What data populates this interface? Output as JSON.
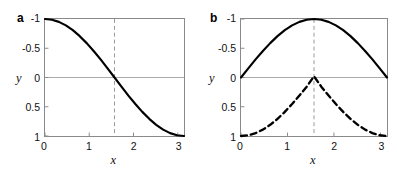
{
  "figure": {
    "background": "#ffffff",
    "panels": [
      {
        "id": "a",
        "label": "a",
        "y_label": "y",
        "x_label": "x",
        "y_ticks": [
          "1",
          "0.5",
          "0",
          "-0.5",
          "-1"
        ],
        "y_tick_values": [
          1,
          0.5,
          0,
          -0.5,
          -1
        ],
        "x_ticks": [
          "0",
          "1",
          "2",
          "3"
        ],
        "x_tick_values": [
          0,
          1,
          2,
          3
        ]
      },
      {
        "id": "b",
        "label": "b",
        "y_label": "y",
        "x_label": "x",
        "y_ticks": [
          "1",
          "0.5",
          "0",
          "-0.5",
          "-1"
        ],
        "y_tick_values": [
          1,
          0.5,
          0,
          -0.5,
          -1
        ],
        "x_ticks": [
          "0",
          "1",
          "2",
          "3"
        ],
        "x_tick_values": [
          0,
          1,
          2,
          3
        ]
      }
    ]
  },
  "chart_data": [
    {
      "type": "line",
      "panel": "a",
      "title": "",
      "xlabel": "x",
      "ylabel": "y",
      "xlim": [
        0,
        3.14159
      ],
      "ylim": [
        -1,
        1
      ],
      "xticks": [
        0,
        1,
        2,
        3
      ],
      "yticks": [
        -1,
        -0.5,
        0,
        0.5,
        1
      ],
      "grid": false,
      "legend": "none",
      "annotations": [
        {
          "kind": "vertical-dashed-line",
          "x": 1.5708,
          "color": "#999999"
        },
        {
          "kind": "horizontal-zero-line",
          "y": 0,
          "color": "#aaaaaa"
        }
      ],
      "series": [
        {
          "name": "cos(x)",
          "style": "solid",
          "color": "#000000",
          "linewidth": 2.2,
          "x": [
            0,
            0.1571,
            0.3142,
            0.4712,
            0.6283,
            0.7854,
            0.9425,
            1.0996,
            1.2566,
            1.4137,
            1.5708,
            1.7279,
            1.885,
            2.042,
            2.1991,
            2.3562,
            2.5133,
            2.6704,
            2.8274,
            2.9845,
            3.1416
          ],
          "y": [
            1.0,
            0.9877,
            0.9511,
            0.891,
            0.809,
            0.7071,
            0.5878,
            0.454,
            0.309,
            0.1564,
            0.0,
            -0.1564,
            -0.309,
            -0.454,
            -0.5878,
            -0.7071,
            -0.809,
            -0.891,
            -0.9511,
            -0.9877,
            -1.0
          ]
        }
      ]
    },
    {
      "type": "line",
      "panel": "b",
      "title": "",
      "xlabel": "x",
      "ylabel": "y",
      "xlim": [
        0,
        3.14159
      ],
      "ylim": [
        -1,
        1
      ],
      "xticks": [
        0,
        1,
        2,
        3
      ],
      "yticks": [
        -1,
        -0.5,
        0,
        0.5,
        1
      ],
      "grid": false,
      "legend": "none",
      "annotations": [
        {
          "kind": "vertical-dashed-line",
          "x": 1.5708,
          "color": "#999999"
        },
        {
          "kind": "horizontal-zero-line",
          "y": 0,
          "color": "#aaaaaa"
        }
      ],
      "series": [
        {
          "name": "sin(x)",
          "style": "solid",
          "color": "#000000",
          "linewidth": 2.2,
          "x": [
            0,
            0.1571,
            0.3142,
            0.4712,
            0.6283,
            0.7854,
            0.9425,
            1.0996,
            1.2566,
            1.4137,
            1.5708,
            1.7279,
            1.885,
            2.042,
            2.1991,
            2.3562,
            2.5133,
            2.6704,
            2.8274,
            2.9845,
            3.1416
          ],
          "y": [
            0.0,
            0.1564,
            0.309,
            0.454,
            0.5878,
            0.7071,
            0.809,
            0.891,
            0.9511,
            0.9877,
            1.0,
            0.9877,
            0.9511,
            0.891,
            0.809,
            0.7071,
            0.5878,
            0.454,
            0.309,
            0.1564,
            0.0
          ]
        },
        {
          "name": "-cos(x)",
          "style": "dashed",
          "color": "#000000",
          "linewidth": 2.4,
          "x": [
            0,
            0.1571,
            0.3142,
            0.4712,
            0.6283,
            0.7854,
            0.9425,
            1.0996,
            1.2566,
            1.4137,
            1.5708,
            1.7279,
            1.885,
            2.042,
            2.1991,
            2.3562,
            2.5133,
            2.6704,
            2.8274,
            2.9845,
            3.1416
          ],
          "y": [
            -1.0,
            -0.9877,
            -0.9511,
            -0.891,
            -0.809,
            -0.7071,
            -0.5878,
            -0.454,
            -0.309,
            -0.1564,
            0.02,
            -0.1564,
            -0.309,
            -0.454,
            -0.5878,
            -0.7071,
            -0.809,
            -0.891,
            -0.9511,
            -0.9877,
            -1.0
          ]
        }
      ]
    }
  ]
}
